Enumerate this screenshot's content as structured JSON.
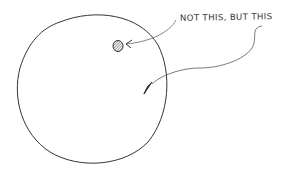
{
  "diagram": {
    "label": "NOT THIS, BUT THIS",
    "colors": {
      "stroke": "#333333",
      "dot_fill": "#555555",
      "background": "#ffffff"
    },
    "elements": [
      {
        "type": "circle",
        "name": "large-circle",
        "cx": 91,
        "cy": 90,
        "r": 75
      },
      {
        "type": "dot",
        "name": "hatched-dot",
        "cx": 118,
        "cy": 46
      },
      {
        "type": "arrow",
        "name": "arrow-to-dot",
        "from": "label-not-this",
        "to": "hatched-dot"
      },
      {
        "type": "arrow",
        "name": "arrow-to-center",
        "from": "label-but-this",
        "to": "inner-point"
      }
    ]
  }
}
